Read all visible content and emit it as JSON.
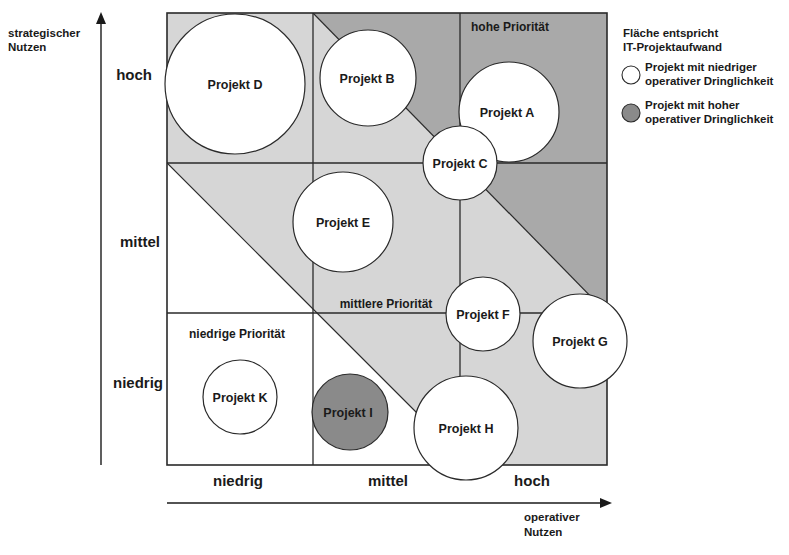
{
  "diagram": {
    "y_axis": {
      "title_line1": "strategischer",
      "title_line2": "Nutzen",
      "levels": [
        "hoch",
        "mittel",
        "niedrig"
      ]
    },
    "x_axis": {
      "title_line1": "operativer",
      "title_line2": "Nutzen",
      "levels": [
        "niedrig",
        "mittel",
        "hoch"
      ]
    },
    "regions": {
      "high": "hohe Priorität",
      "medium": "mittlere Priorität",
      "low": "niedrige Priorität"
    },
    "legend": {
      "title_line1": "Fläche entspricht",
      "title_line2": "IT-Projektaufwand",
      "low_urgency_line1": "Projekt mit niedriger",
      "low_urgency_line2": "operativer Dringlichkeit",
      "high_urgency_line1": "Projekt mit hoher",
      "high_urgency_line2": "operativer Dringlichkeit"
    },
    "colors": {
      "high_region": "#a9a9a9",
      "medium_region": "#d6d6d6",
      "low_region": "#ffffff",
      "low_urgency_fill": "#ffffff",
      "high_urgency_fill": "#8a8a8a",
      "stroke": "#2a2a2a"
    },
    "projects": [
      {
        "label": "Projekt A",
        "urgency": "niedrig"
      },
      {
        "label": "Projekt B",
        "urgency": "niedrig"
      },
      {
        "label": "Projekt C",
        "urgency": "niedrig"
      },
      {
        "label": "Projekt D",
        "urgency": "niedrig"
      },
      {
        "label": "Projekt E",
        "urgency": "niedrig"
      },
      {
        "label": "Projekt F",
        "urgency": "niedrig"
      },
      {
        "label": "Projekt G",
        "urgency": "niedrig"
      },
      {
        "label": "Projekt H",
        "urgency": "niedrig"
      },
      {
        "label": "Projekt I",
        "urgency": "hoch"
      },
      {
        "label": "Projekt K",
        "urgency": "niedrig"
      }
    ]
  }
}
